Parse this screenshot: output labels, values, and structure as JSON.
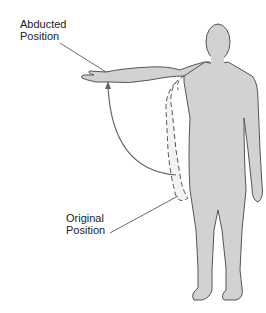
{
  "labels": {
    "abducted": {
      "line1": "Abducted",
      "line2": "Position"
    },
    "original": {
      "line1": "Original",
      "line2": "Position"
    }
  },
  "colors": {
    "body_fill": "#d2d2d2",
    "outline": "#555555",
    "ghost_fill": "#f2f2f2",
    "arrow": "#666666",
    "text": "#222222"
  }
}
